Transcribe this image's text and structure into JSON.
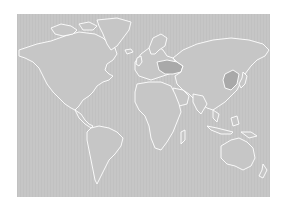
{
  "map": {
    "type": "world-outline-choropleth",
    "projection": "equirectangular",
    "colors": {
      "page_background": "#ffffff",
      "base_fill": "#c6c6c6",
      "border": "#ffffff",
      "highlight_fill": "#a9a9a9"
    },
    "highlighted_regions": [
      {
        "name": "Eastern Europe (Ukraine / Belarus / Poland area)",
        "fill": "#a9a9a9"
      },
      {
        "name": "Northeast China / Korea area",
        "fill": "#a9a9a9"
      }
    ],
    "labels": []
  }
}
